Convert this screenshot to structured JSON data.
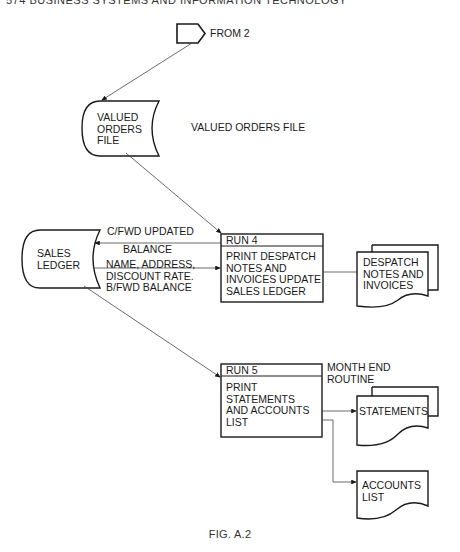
{
  "header": {
    "text": "574   BUSINESS SYSTEMS AND INFORMATION TECHNOLOGY"
  },
  "connector": {
    "label": "FROM 2",
    "icon": "off-page-connector-icon"
  },
  "valued_orders_file": {
    "symbol_text": "VALUED\nORDERS\nFILE",
    "side_label": "VALUED ORDERS FILE",
    "icon": "stored-data-icon"
  },
  "sales_ledger": {
    "symbol_text": "SALES\nLEDGER",
    "icon": "stored-data-icon"
  },
  "flows": {
    "cfwd": "C/FWD UPDATED",
    "balance": "BALANCE",
    "name_addr": "NAME, ADDRESS,\nDISCOUNT RATE.\nB/FWD BALANCE"
  },
  "run4": {
    "title": "RUN 4",
    "body": "PRINT DESPATCH\nNOTES AND\nINVOICES UPDATE\nSALES LEDGER"
  },
  "despatch": {
    "text": "DESPATCH\nNOTES AND\nINVOICES",
    "icon": "multi-document-icon"
  },
  "run5": {
    "title": "RUN 5",
    "body": "PRINT\nSTATEMENTS\nAND ACCOUNTS\nLIST",
    "note": "MONTH END\nROUTINE"
  },
  "statements": {
    "text": "STATEMENTS",
    "icon": "multi-document-icon"
  },
  "accounts_list": {
    "text": "ACCOUNTS\nLIST",
    "icon": "document-icon"
  },
  "caption": "FIG. A.2",
  "colors": {
    "ink": "#1a1a1a",
    "line": "#444444",
    "background": "#ffffff"
  }
}
